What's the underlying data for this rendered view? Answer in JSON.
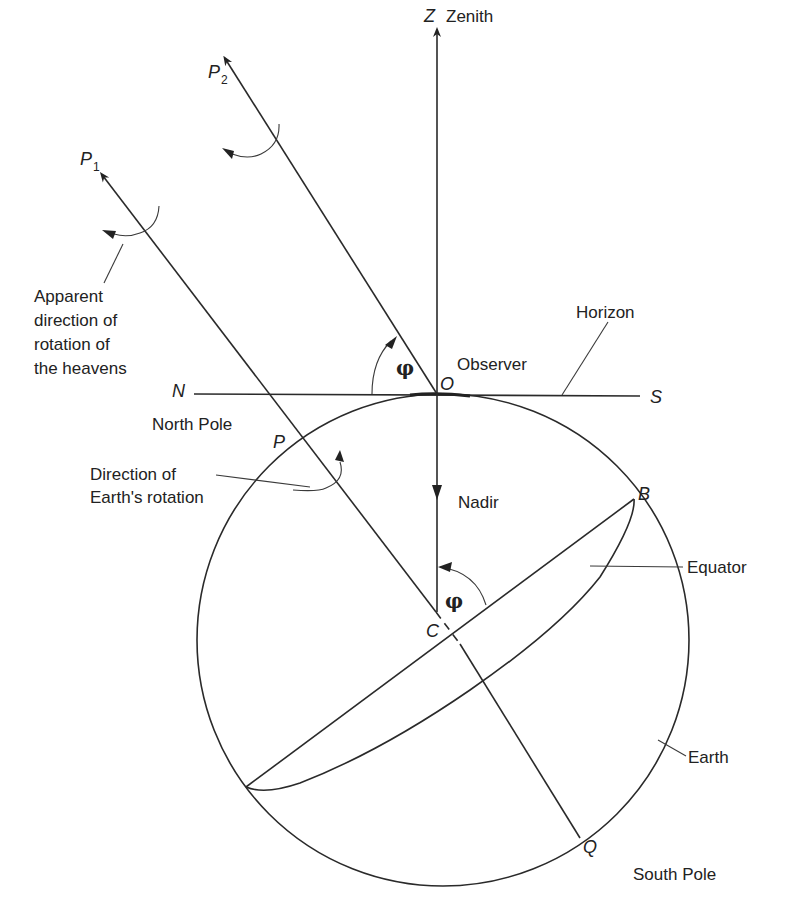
{
  "diagram": {
    "labels": {
      "zenith_var": "Z",
      "zenith": "Zenith",
      "p1_var": "P",
      "p1_sub": "1",
      "p2_var": "P",
      "p2_sub": "2",
      "apparent_line1": "Apparent",
      "apparent_line2": "direction of",
      "apparent_line3": "rotation of",
      "apparent_line4": "the heavens",
      "horizon": "Horizon",
      "observer": "Observer",
      "n": "N",
      "o": "O",
      "s": "S",
      "north_pole": "North Pole",
      "p": "P",
      "earth_rot_line1": "Direction of",
      "earth_rot_line2": "Earth's rotation",
      "nadir": "Nadir",
      "b": "B",
      "equator": "Equator",
      "phi_top": "φ",
      "phi_center": "φ",
      "c": "C",
      "earth": "Earth",
      "q": "Q",
      "south_pole": "South Pole"
    }
  }
}
